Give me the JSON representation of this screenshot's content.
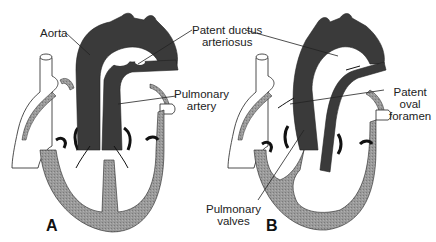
{
  "figure": {
    "panels": [
      {
        "id": "A",
        "label": "A",
        "annotations": [
          {
            "key": "aorta",
            "text": "Aorta"
          },
          {
            "key": "pda",
            "line1": "Patent ductus",
            "line2": "arteriosus"
          },
          {
            "key": "pulmonary_artery",
            "line1": "Pulmonary",
            "line2": "artery"
          }
        ]
      },
      {
        "id": "B",
        "label": "B",
        "annotations": [
          {
            "key": "pfo",
            "line1": "Patent",
            "line2": "oval",
            "line3": "foramen"
          },
          {
            "key": "pulmonary_valves",
            "line1": "Pulmonary",
            "line2": "valves"
          }
        ]
      }
    ],
    "colors": {
      "vessel_dark": "#3a3a3a",
      "muscle_gray": "#8e8e8e",
      "outline": "#222222",
      "background": "#ffffff"
    }
  }
}
